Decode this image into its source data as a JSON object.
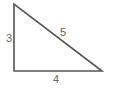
{
  "diagram": {
    "type": "right-triangle",
    "background": "#ffffff",
    "stroke_color": "#555555",
    "label_color": "#666666",
    "vertices": {
      "top": [
        14,
        4
      ],
      "bottom_left": [
        14,
        71
      ],
      "bottom_right": [
        102,
        71
      ]
    },
    "sides": {
      "vertical": {
        "label": "3",
        "pos": [
          9,
          42
        ]
      },
      "hypotenuse": {
        "label": "5",
        "pos": [
          63,
          36
        ]
      },
      "base": {
        "label": "4",
        "pos": [
          56,
          83
        ]
      }
    }
  }
}
